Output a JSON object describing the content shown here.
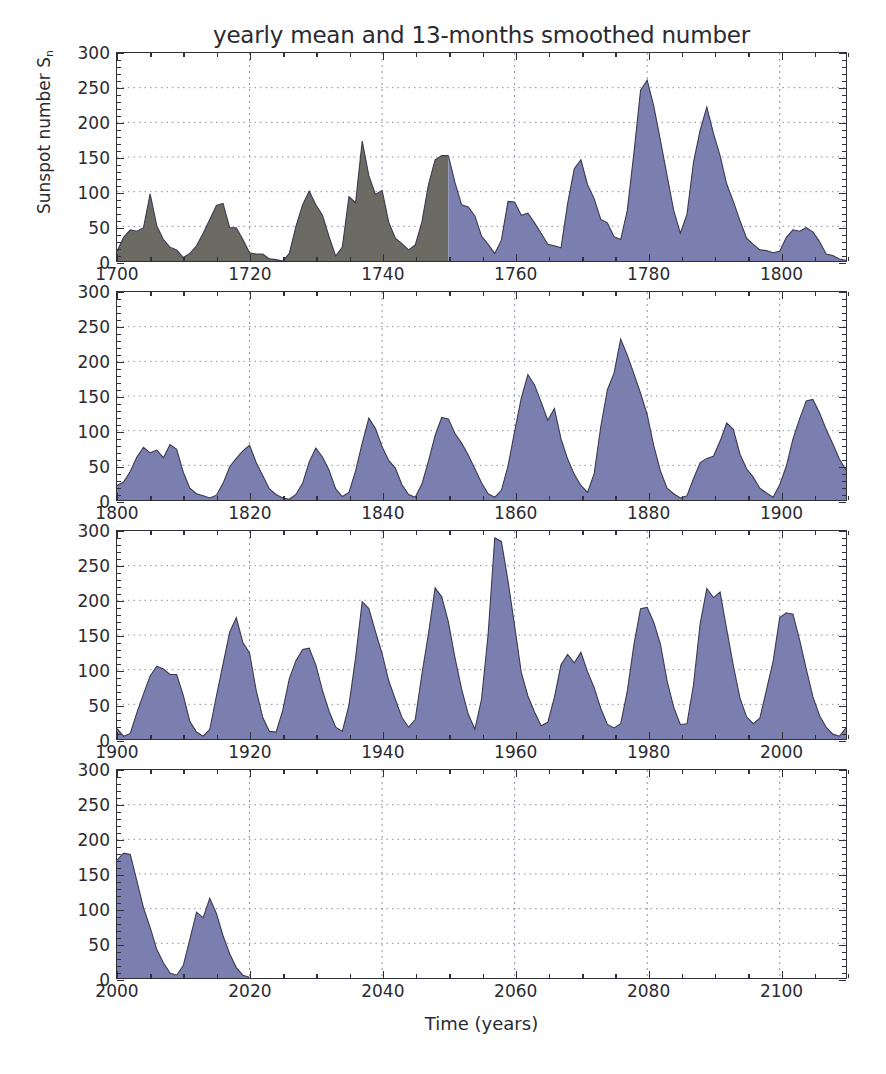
{
  "chart_data": {
    "type": "area",
    "title": "yearly mean and 13-months smoothed number",
    "xlabel": "Time (years)",
    "ylabel": "Sunspot number S",
    "ylabel_sub": "n",
    "ylim": [
      0,
      300
    ],
    "yticks": [
      0,
      50,
      100,
      150,
      200,
      250,
      300
    ],
    "grid": true,
    "legend_position": "none",
    "colors": {
      "historic_fill": "#6b6b63",
      "modern_fill": "#7b7fb0",
      "line": "#3a3a52",
      "axis": "#303038",
      "grid": "#8f8fa8",
      "background": "#ffffff"
    },
    "series_name": "Sunspot number S_n",
    "historic_split_year": 1750,
    "panels": [
      {
        "name": "panel-1700-1810",
        "xlim": [
          1700,
          1810
        ],
        "xticks": [
          1700,
          1720,
          1740,
          1760,
          1780,
          1800
        ],
        "x": [
          1700,
          1701,
          1702,
          1703,
          1704,
          1705,
          1706,
          1707,
          1708,
          1709,
          1710,
          1711,
          1712,
          1713,
          1714,
          1715,
          1716,
          1717,
          1718,
          1719,
          1720,
          1721,
          1722,
          1723,
          1724,
          1725,
          1726,
          1727,
          1728,
          1729,
          1730,
          1731,
          1732,
          1733,
          1734,
          1735,
          1736,
          1737,
          1738,
          1739,
          1740,
          1741,
          1742,
          1743,
          1744,
          1745,
          1746,
          1747,
          1748,
          1749,
          1750,
          1751,
          1752,
          1753,
          1754,
          1755,
          1756,
          1757,
          1758,
          1759,
          1760,
          1761,
          1762,
          1763,
          1764,
          1765,
          1766,
          1767,
          1768,
          1769,
          1770,
          1771,
          1772,
          1773,
          1774,
          1775,
          1776,
          1777,
          1778,
          1779,
          1780,
          1781,
          1782,
          1783,
          1784,
          1785,
          1786,
          1787,
          1788,
          1789,
          1790,
          1791,
          1792,
          1793,
          1794,
          1795,
          1796,
          1797,
          1798,
          1799,
          1800,
          1801,
          1802,
          1803,
          1804,
          1805,
          1806,
          1807,
          1808,
          1809,
          1810
        ],
        "y": [
          14,
          34,
          45,
          43,
          48,
          97,
          51,
          31,
          20,
          16,
          5,
          11,
          22,
          40,
          60,
          80,
          83,
          48,
          48,
          31,
          12,
          10,
          10,
          3,
          2,
          0,
          11,
          50,
          81,
          101,
          81,
          66,
          35,
          7,
          20,
          93,
          84,
          173,
          123,
          96,
          102,
          56,
          33,
          25,
          16,
          23,
          56,
          110,
          146,
          152,
          152,
          113,
          81,
          78,
          65,
          36,
          24,
          11,
          30,
          86,
          85,
          66,
          69,
          55,
          40,
          24,
          22,
          19,
          83,
          133,
          146,
          110,
          90,
          60,
          55,
          35,
          31,
          73,
          156,
          246,
          261,
          223,
          174,
          123,
          73,
          40,
          67,
          143,
          189,
          222,
          184,
          152,
          111,
          86,
          58,
          33,
          24,
          16,
          15,
          12,
          14,
          34,
          45,
          43,
          48,
          42,
          28,
          10,
          8,
          3,
          1
        ]
      },
      {
        "name": "panel-1800-1910",
        "xlim": [
          1800,
          1910
        ],
        "xticks": [
          1800,
          1820,
          1840,
          1860,
          1880,
          1900
        ],
        "x": [
          1800,
          1801,
          1802,
          1803,
          1804,
          1805,
          1806,
          1807,
          1808,
          1809,
          1810,
          1811,
          1812,
          1813,
          1814,
          1815,
          1816,
          1817,
          1818,
          1819,
          1820,
          1821,
          1822,
          1823,
          1824,
          1825,
          1826,
          1827,
          1828,
          1829,
          1830,
          1831,
          1832,
          1833,
          1834,
          1835,
          1836,
          1837,
          1838,
          1839,
          1840,
          1841,
          1842,
          1843,
          1844,
          1845,
          1846,
          1847,
          1848,
          1849,
          1850,
          1851,
          1852,
          1853,
          1854,
          1855,
          1856,
          1857,
          1858,
          1859,
          1860,
          1861,
          1862,
          1863,
          1864,
          1865,
          1866,
          1867,
          1868,
          1869,
          1870,
          1871,
          1872,
          1873,
          1874,
          1875,
          1876,
          1877,
          1878,
          1879,
          1880,
          1881,
          1882,
          1883,
          1884,
          1885,
          1886,
          1887,
          1888,
          1889,
          1890,
          1891,
          1892,
          1893,
          1894,
          1895,
          1896,
          1897,
          1898,
          1899,
          1900,
          1901,
          1902,
          1903,
          1904,
          1905,
          1906,
          1907,
          1908,
          1909,
          1910
        ],
        "y": [
          21,
          26,
          41,
          62,
          76,
          68,
          72,
          61,
          80,
          73,
          40,
          17,
          9,
          6,
          3,
          7,
          24,
          48,
          60,
          71,
          79,
          54,
          35,
          16,
          8,
          3,
          1,
          8,
          24,
          55,
          75,
          62,
          43,
          16,
          5,
          11,
          42,
          82,
          118,
          103,
          77,
          57,
          46,
          22,
          8,
          4,
          23,
          56,
          93,
          119,
          117,
          96,
          82,
          65,
          45,
          25,
          9,
          4,
          14,
          49,
          99,
          147,
          181,
          166,
          141,
          115,
          132,
          88,
          59,
          37,
          21,
          11,
          38,
          106,
          159,
          183,
          232,
          209,
          182,
          154,
          123,
          78,
          42,
          17,
          9,
          3,
          6,
          31,
          54,
          60,
          63,
          85,
          111,
          102,
          66,
          45,
          33,
          17,
          10,
          4,
          22,
          49,
          88,
          117,
          143,
          145,
          126,
          102,
          81,
          59,
          43,
          30,
          16,
          8,
          3,
          6,
          28,
          57,
          90,
          113,
          106,
          85,
          64,
          44,
          27,
          13,
          6,
          2,
          1,
          5,
          16,
          39,
          66,
          93,
          110,
          99,
          84,
          69,
          52,
          35,
          22,
          11,
          8,
          17,
          43,
          71,
          95,
          108,
          96,
          74,
          51,
          33,
          18,
          9,
          4,
          8,
          26,
          55,
          84,
          104,
          110,
          98,
          77,
          53
        ]
      },
      {
        "name": "panel-1900-2010",
        "xlim": [
          1900,
          2010
        ],
        "xticks": [
          1900,
          1920,
          1940,
          1960,
          1980,
          2000
        ],
        "x": [
          1900,
          1901,
          1902,
          1903,
          1904,
          1905,
          1906,
          1907,
          1908,
          1909,
          1910,
          1911,
          1912,
          1913,
          1914,
          1915,
          1916,
          1917,
          1918,
          1919,
          1920,
          1921,
          1922,
          1923,
          1924,
          1925,
          1926,
          1927,
          1928,
          1929,
          1930,
          1931,
          1932,
          1933,
          1934,
          1935,
          1936,
          1937,
          1938,
          1939,
          1940,
          1941,
          1942,
          1943,
          1944,
          1945,
          1946,
          1947,
          1948,
          1949,
          1950,
          1951,
          1952,
          1953,
          1954,
          1955,
          1956,
          1957,
          1958,
          1959,
          1960,
          1961,
          1962,
          1963,
          1964,
          1965,
          1966,
          1967,
          1968,
          1969,
          1970,
          1971,
          1972,
          1973,
          1974,
          1975,
          1976,
          1977,
          1978,
          1979,
          1980,
          1981,
          1982,
          1983,
          1984,
          1985,
          1986,
          1987,
          1988,
          1989,
          1990,
          1991,
          1992,
          1993,
          1994,
          1995,
          1996,
          1997,
          1998,
          1999,
          2000,
          2001,
          2002,
          2003,
          2004,
          2005,
          2006,
          2007,
          2008,
          2009,
          2010
        ],
        "y": [
          15,
          4,
          8,
          38,
          65,
          91,
          105,
          101,
          93,
          93,
          63,
          25,
          10,
          4,
          14,
          62,
          108,
          154,
          175,
          139,
          124,
          70,
          31,
          11,
          10,
          41,
          87,
          113,
          129,
          131,
          107,
          70,
          40,
          17,
          11,
          49,
          117,
          198,
          188,
          155,
          123,
          84,
          57,
          31,
          17,
          28,
          93,
          152,
          218,
          205,
          169,
          117,
          72,
          36,
          14,
          57,
          151,
          290,
          285,
          228,
          163,
          96,
          62,
          39,
          19,
          24,
          60,
          107,
          122,
          110,
          125,
          97,
          74,
          44,
          21,
          16,
          22,
          69,
          136,
          188,
          190,
          168,
          137,
          84,
          46,
          21,
          22,
          79,
          167,
          217,
          204,
          212,
          158,
          106,
          59,
          32,
          22,
          30,
          71,
          112,
          175,
          182,
          180,
          143,
          101,
          61,
          34,
          17,
          7,
          4,
          16
        ]
      },
      {
        "name": "panel-2000-2110",
        "xlim": [
          2000,
          2110
        ],
        "xticks": [
          2000,
          2020,
          2040,
          2060,
          2080,
          2100
        ],
        "x": [
          2000,
          2001,
          2002,
          2003,
          2004,
          2005,
          2006,
          2007,
          2008,
          2009,
          2010,
          2011,
          2012,
          2013,
          2014,
          2015,
          2016,
          2017,
          2018,
          2019,
          2020
        ],
        "y": [
          170,
          180,
          178,
          140,
          101,
          73,
          41,
          22,
          7,
          4,
          18,
          56,
          95,
          87,
          115,
          93,
          61,
          35,
          15,
          4,
          1
        ]
      }
    ]
  }
}
